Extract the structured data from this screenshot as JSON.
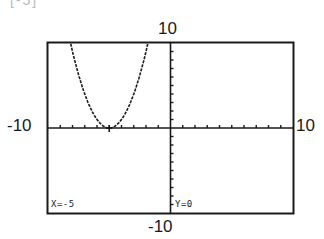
{
  "top_fragment": "[-5]",
  "window": {
    "xmin": -10,
    "xmax": 10,
    "ymin": -10,
    "ymax": 10,
    "xscl": 1,
    "yscl": 1,
    "labels": {
      "xmin": "-10",
      "xmax": "10",
      "ymin": "-10",
      "ymax": "10"
    }
  },
  "trace": {
    "x_text": "X=-5",
    "y_text": "Y=0",
    "cursor": {
      "x": -5,
      "y": 0
    }
  },
  "chart_data": {
    "type": "line",
    "title": "",
    "xlabel": "",
    "ylabel": "",
    "xlim": [
      -10,
      10
    ],
    "ylim": [
      -10,
      10
    ],
    "grid": false,
    "series": [
      {
        "name": "Y1 = (X+5)^2",
        "x": [
          -8.2,
          -8,
          -7,
          -6,
          -5,
          -4,
          -3,
          -2,
          -1.8
        ],
        "values": [
          10.24,
          9,
          4,
          1,
          0,
          1,
          4,
          9,
          10.24
        ]
      }
    ],
    "annotations": [
      "X=-5",
      "Y=0"
    ]
  },
  "colors": {
    "ink": "#1a1a1a",
    "background": "#ffffff"
  }
}
